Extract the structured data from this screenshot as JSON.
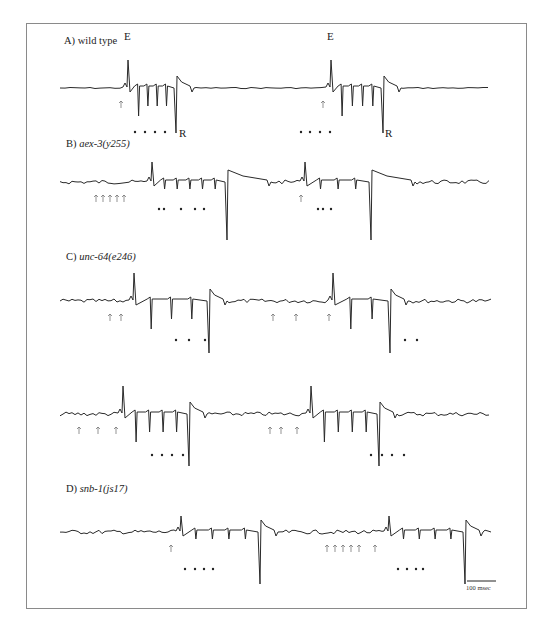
{
  "figure": {
    "panels": [
      {
        "id": "A",
        "prefix": "A) ",
        "name": "wild type",
        "italic": false,
        "label_x": 64,
        "label_y": 44
      },
      {
        "id": "B",
        "prefix": "B) ",
        "name": "aex-3(y255)",
        "italic": true,
        "label_x": 66,
        "label_y": 147
      },
      {
        "id": "C",
        "prefix": "C) ",
        "name": "unc-64(e246)",
        "italic": true,
        "label_x": 66,
        "label_y": 260
      },
      {
        "id": "D",
        "prefix": "D) ",
        "name": "snb-1(js17)",
        "italic": true,
        "label_x": 66,
        "label_y": 492
      }
    ],
    "peak_labels": [
      {
        "text": "E",
        "x": 124,
        "y": 40
      },
      {
        "text": "R",
        "x": 179,
        "y": 137
      },
      {
        "text": "E",
        "x": 327,
        "y": 40
      },
      {
        "text": "R",
        "x": 385,
        "y": 137
      }
    ],
    "scale_bar": {
      "label": "100 msec",
      "x1": 467,
      "x2": 496,
      "y": 581
    }
  },
  "chart_data": {
    "type": "line",
    "xlabel": "time",
    "ylabel": "",
    "scale_bar": "100 msec",
    "series": [
      {
        "name": "A) wild type",
        "baseline_y": 88,
        "events": [
          {
            "E_x": 128,
            "R_x": 176,
            "inter_spikes": 4,
            "up_arrows": [
              121
            ]
          },
          {
            "E_x": 331,
            "R_x": 383,
            "inter_spikes": 4,
            "up_arrows": [
              323
            ]
          }
        ]
      },
      {
        "name": "B) aex-3(y255)",
        "baseline_y": 182,
        "events": [
          {
            "E_x": 152,
            "R_x": 227,
            "inter_spikes": 5,
            "up_arrows": [
              96,
              103,
              110,
              117,
              124
            ]
          },
          {
            "E_x": 305,
            "R_x": 371,
            "inter_spikes": 3,
            "up_arrows": [
              301
            ]
          }
        ]
      },
      {
        "name": "C) unc-64(e246) row 1",
        "baseline_y": 301,
        "events": [
          {
            "E_x": 134,
            "R_x": 209,
            "inter_spikes": 3,
            "up_arrows": [
              110,
              121
            ]
          },
          {
            "E_x": 333,
            "R_x": 390,
            "inter_spikes": 2,
            "up_arrows": [
              273,
              296,
              329
            ]
          }
        ]
      },
      {
        "name": "C) unc-64(e246) row 2",
        "baseline_y": 414,
        "events": [
          {
            "E_x": 123,
            "R_x": 189,
            "inter_spikes": 4,
            "up_arrows": [
              79,
              98,
              116
            ]
          },
          {
            "E_x": 311,
            "R_x": 379,
            "inter_spikes": 4,
            "up_arrows": [
              270,
              281,
              297
            ]
          }
        ]
      },
      {
        "name": "D) snb-1(js17)",
        "baseline_y": 532,
        "events": [
          {
            "E_x": 181,
            "R_x": 260,
            "inter_spikes": 4,
            "up_arrows": [
              171
            ]
          },
          {
            "E_x": 389,
            "R_x": 465,
            "inter_spikes": 4,
            "up_arrows": [
              327,
              335,
              343,
              351,
              359,
              375
            ]
          }
        ]
      }
    ],
    "dots": [
      {
        "row": "A",
        "y": 132,
        "xs": [
          135,
          145,
          155,
          165,
          301,
          310,
          320,
          330
        ]
      },
      {
        "row": "B",
        "y": 209,
        "xs": [
          159,
          164,
          181,
          195,
          204,
          318,
          323,
          331
        ]
      },
      {
        "row": "C1",
        "y": 340,
        "xs": [
          176,
          189,
          205,
          405,
          417
        ]
      },
      {
        "row": "C2",
        "y": 455,
        "xs": [
          152,
          162,
          172,
          183,
          371,
          382,
          392,
          404
        ]
      },
      {
        "row": "D",
        "y": 569,
        "xs": [
          185,
          195,
          204,
          213,
          398,
          407,
          416,
          423
        ]
      }
    ]
  }
}
